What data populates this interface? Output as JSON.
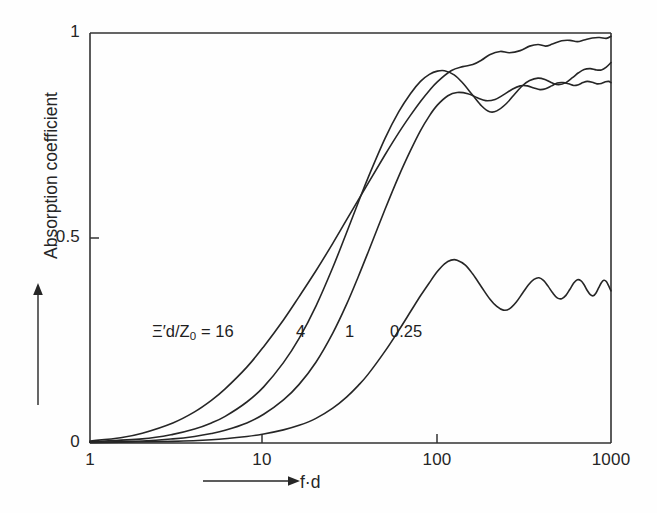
{
  "chart_data": {
    "type": "line",
    "title": "",
    "xlabel": "f·d",
    "ylabel": "Absorption coefficient",
    "xscale": "log",
    "xlim": [
      1,
      1000
    ],
    "ylim": [
      0,
      1
    ],
    "x_ticks": [
      "1",
      "10",
      "100",
      "1000"
    ],
    "x_tick_values": [
      1,
      10,
      100,
      1000
    ],
    "y_ticks": [
      "0",
      "0.5",
      "1"
    ],
    "y_tick_values": [
      0,
      0.5,
      1
    ],
    "grid": false,
    "legend": "inline-curve-labels",
    "legend_prefix": "Ξ′d/Z",
    "legend_prefix_sub": "0",
    "legend_equals": "= 16",
    "series": [
      {
        "name": "16",
        "label": "Ξ′d/Z0 = 16",
        "points": [
          [
            1,
            0.005
          ],
          [
            1.5,
            0.013
          ],
          [
            2,
            0.024
          ],
          [
            3,
            0.049
          ],
          [
            4,
            0.076
          ],
          [
            5,
            0.104
          ],
          [
            6,
            0.132
          ],
          [
            8,
            0.185
          ],
          [
            10,
            0.235
          ],
          [
            13,
            0.3
          ],
          [
            16,
            0.357
          ],
          [
            20,
            0.42
          ],
          [
            25,
            0.487
          ],
          [
            30,
            0.544
          ],
          [
            40,
            0.634
          ],
          [
            50,
            0.703
          ],
          [
            60,
            0.757
          ],
          [
            70,
            0.799
          ],
          [
            80,
            0.833
          ],
          [
            90,
            0.86
          ],
          [
            100,
            0.881
          ],
          [
            120,
            0.908
          ],
          [
            140,
            0.918
          ],
          [
            160,
            0.923
          ],
          [
            180,
            0.934
          ],
          [
            200,
            0.947
          ],
          [
            230,
            0.955
          ],
          [
            260,
            0.952
          ],
          [
            300,
            0.957
          ],
          [
            340,
            0.968
          ],
          [
            380,
            0.972
          ],
          [
            420,
            0.968
          ],
          [
            460,
            0.973
          ],
          [
            520,
            0.981
          ],
          [
            580,
            0.982
          ],
          [
            640,
            0.979
          ],
          [
            700,
            0.983
          ],
          [
            780,
            0.988
          ],
          [
            860,
            0.989
          ],
          [
            940,
            0.987
          ],
          [
            1000,
            0.992
          ]
        ]
      },
      {
        "name": "4",
        "label": "4",
        "points": [
          [
            1,
            0.003
          ],
          [
            2,
            0.01
          ],
          [
            3,
            0.021
          ],
          [
            4,
            0.034
          ],
          [
            5,
            0.049
          ],
          [
            6,
            0.065
          ],
          [
            8,
            0.1
          ],
          [
            10,
            0.137
          ],
          [
            13,
            0.196
          ],
          [
            16,
            0.255
          ],
          [
            20,
            0.334
          ],
          [
            25,
            0.428
          ],
          [
            30,
            0.513
          ],
          [
            35,
            0.586
          ],
          [
            40,
            0.648
          ],
          [
            50,
            0.743
          ],
          [
            60,
            0.808
          ],
          [
            70,
            0.852
          ],
          [
            80,
            0.882
          ],
          [
            90,
            0.899
          ],
          [
            100,
            0.907
          ],
          [
            110,
            0.908
          ],
          [
            125,
            0.898
          ],
          [
            140,
            0.878
          ],
          [
            160,
            0.848
          ],
          [
            180,
            0.822
          ],
          [
            200,
            0.808
          ],
          [
            220,
            0.81
          ],
          [
            250,
            0.828
          ],
          [
            280,
            0.852
          ],
          [
            310,
            0.872
          ],
          [
            340,
            0.884
          ],
          [
            380,
            0.89
          ],
          [
            420,
            0.886
          ],
          [
            460,
            0.878
          ],
          [
            500,
            0.874
          ],
          [
            550,
            0.879
          ],
          [
            600,
            0.891
          ],
          [
            650,
            0.903
          ],
          [
            700,
            0.911
          ],
          [
            760,
            0.913
          ],
          [
            820,
            0.91
          ],
          [
            880,
            0.91
          ],
          [
            940,
            0.917
          ],
          [
            1000,
            0.928
          ]
        ]
      },
      {
        "name": "1",
        "label": "1",
        "points": [
          [
            1,
            0.002
          ],
          [
            2,
            0.005
          ],
          [
            3,
            0.01
          ],
          [
            4,
            0.016
          ],
          [
            5,
            0.023
          ],
          [
            6,
            0.031
          ],
          [
            8,
            0.049
          ],
          [
            10,
            0.07
          ],
          [
            13,
            0.105
          ],
          [
            16,
            0.143
          ],
          [
            20,
            0.197
          ],
          [
            25,
            0.268
          ],
          [
            30,
            0.338
          ],
          [
            35,
            0.405
          ],
          [
            40,
            0.466
          ],
          [
            50,
            0.57
          ],
          [
            60,
            0.651
          ],
          [
            70,
            0.713
          ],
          [
            80,
            0.762
          ],
          [
            90,
            0.798
          ],
          [
            100,
            0.824
          ],
          [
            115,
            0.847
          ],
          [
            130,
            0.855
          ],
          [
            150,
            0.852
          ],
          [
            170,
            0.842
          ],
          [
            190,
            0.835
          ],
          [
            215,
            0.838
          ],
          [
            240,
            0.849
          ],
          [
            270,
            0.863
          ],
          [
            300,
            0.871
          ],
          [
            330,
            0.871
          ],
          [
            360,
            0.866
          ],
          [
            390,
            0.862
          ],
          [
            420,
            0.864
          ],
          [
            455,
            0.871
          ],
          [
            490,
            0.878
          ],
          [
            530,
            0.879
          ],
          [
            570,
            0.876
          ],
          [
            610,
            0.872
          ],
          [
            650,
            0.874
          ],
          [
            690,
            0.879
          ],
          [
            730,
            0.882
          ],
          [
            780,
            0.88
          ],
          [
            830,
            0.876
          ],
          [
            880,
            0.877
          ],
          [
            930,
            0.881
          ],
          [
            970,
            0.882
          ],
          [
            1000,
            0.879
          ]
        ]
      },
      {
        "name": "0.25",
        "label": "0.25",
        "points": [
          [
            1,
            0.001
          ],
          [
            3,
            0.004
          ],
          [
            5,
            0.008
          ],
          [
            8,
            0.016
          ],
          [
            10,
            0.022
          ],
          [
            13,
            0.032
          ],
          [
            16,
            0.043
          ],
          [
            20,
            0.06
          ],
          [
            25,
            0.085
          ],
          [
            30,
            0.112
          ],
          [
            35,
            0.14
          ],
          [
            40,
            0.168
          ],
          [
            50,
            0.224
          ],
          [
            60,
            0.275
          ],
          [
            70,
            0.32
          ],
          [
            80,
            0.359
          ],
          [
            90,
            0.391
          ],
          [
            100,
            0.418
          ],
          [
            110,
            0.437
          ],
          [
            120,
            0.446
          ],
          [
            130,
            0.446
          ],
          [
            145,
            0.434
          ],
          [
            160,
            0.412
          ],
          [
            180,
            0.38
          ],
          [
            200,
            0.352
          ],
          [
            220,
            0.333
          ],
          [
            240,
            0.324
          ],
          [
            260,
            0.327
          ],
          [
            285,
            0.344
          ],
          [
            310,
            0.366
          ],
          [
            335,
            0.386
          ],
          [
            360,
            0.399
          ],
          [
            385,
            0.403
          ],
          [
            410,
            0.396
          ],
          [
            435,
            0.382
          ],
          [
            460,
            0.367
          ],
          [
            490,
            0.354
          ],
          [
            520,
            0.352
          ],
          [
            550,
            0.36
          ],
          [
            580,
            0.375
          ],
          [
            610,
            0.39
          ],
          [
            640,
            0.398
          ],
          [
            670,
            0.396
          ],
          [
            700,
            0.386
          ],
          [
            730,
            0.372
          ],
          [
            760,
            0.362
          ],
          [
            790,
            0.359
          ],
          [
            820,
            0.366
          ],
          [
            850,
            0.379
          ],
          [
            880,
            0.391
          ],
          [
            910,
            0.397
          ],
          [
            940,
            0.394
          ],
          [
            970,
            0.383
          ],
          [
            1000,
            0.371
          ]
        ]
      }
    ],
    "series_label_positions": [
      {
        "name": "16",
        "x_px": 246,
        "y_px": 331
      },
      {
        "name": "4",
        "x_px": 302,
        "y_px": 331
      },
      {
        "name": "1",
        "x_px": 350,
        "y_px": 331
      },
      {
        "name": "0.25",
        "x_px": 398,
        "y_px": 331
      }
    ],
    "colors": {
      "background": "#fefefe",
      "axis": "#333333",
      "curve": "#262626",
      "text": "#262626"
    }
  },
  "axes": {
    "x_title": "f·d",
    "y_title": "Absorption coefficient"
  }
}
